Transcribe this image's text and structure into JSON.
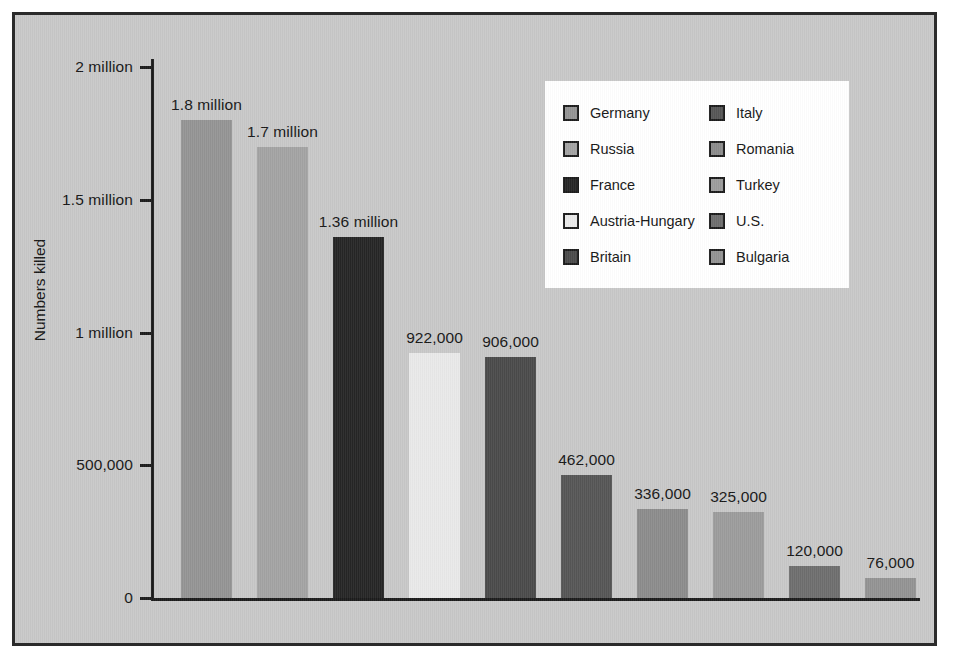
{
  "figure": {
    "background_color": "#c8c8c8",
    "frame_color": "#2b2b2b",
    "axis_color": "#1c1c1c"
  },
  "chart_data": {
    "type": "bar",
    "title": "",
    "xlabel": "",
    "ylabel": "Numbers killed",
    "ylim": [
      0,
      2000000
    ],
    "grid": false,
    "legend_position": "upper-right",
    "ytick_values": [
      0,
      500000,
      1000000,
      1500000,
      2000000
    ],
    "ytick_labels": [
      "0",
      "500,000",
      "1 million",
      "1.5 million",
      "2 million"
    ],
    "categories": [
      "Germany",
      "Russia",
      "France",
      "Austria-Hungary",
      "Britain",
      "Italy",
      "Romania",
      "Turkey",
      "U.S.",
      "Bulgaria"
    ],
    "values": [
      1800000,
      1700000,
      1360000,
      922000,
      906000,
      462000,
      336000,
      325000,
      120000,
      76000
    ],
    "data_labels": [
      "1.8 million",
      "1.7 million",
      "1.36 million",
      "922,000",
      "906,000",
      "462,000",
      "336,000",
      "325,000",
      "120,000",
      "76,000"
    ],
    "colors": [
      "#949494",
      "#a3a3a3",
      "#262626",
      "#e9e9e9",
      "#4a4a4a",
      "#565656",
      "#8c8c8c",
      "#9c9c9c",
      "#6e6e6e",
      "#939393"
    ]
  },
  "legend": {
    "background_color": "#ffffff",
    "left_column": [
      {
        "label": "Germany",
        "color": "#949494"
      },
      {
        "label": "Russia",
        "color": "#a3a3a3"
      },
      {
        "label": "France",
        "color": "#262626"
      },
      {
        "label": "Austria-Hungary",
        "color": "#e9e9e9"
      },
      {
        "label": "Britain",
        "color": "#4a4a4a"
      }
    ],
    "right_column": [
      {
        "label": "Italy",
        "color": "#565656"
      },
      {
        "label": "Romania",
        "color": "#8c8c8c"
      },
      {
        "label": "Turkey",
        "color": "#9c9c9c"
      },
      {
        "label": "U.S.",
        "color": "#6e6e6e"
      },
      {
        "label": "Bulgaria",
        "color": "#939393"
      }
    ]
  }
}
